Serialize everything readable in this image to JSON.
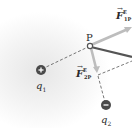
{
  "diagram": {
    "point": {
      "label": "P"
    },
    "charges": [
      {
        "id": "q1",
        "label": "q",
        "subscript": "1",
        "sign": "+",
        "color": "#4a4a4a"
      },
      {
        "id": "q2",
        "label": "q",
        "subscript": "2",
        "sign": "−",
        "color": "#4a4a4a"
      }
    ],
    "vectors": [
      {
        "id": "F1P",
        "symbol": "F",
        "arrow": "→",
        "superscript": "E",
        "subscript": "1P",
        "color": "#bdbdbd"
      },
      {
        "id": "F2P",
        "symbol": "F",
        "arrow": "→",
        "superscript": "E",
        "subscript": "2P",
        "color": "#bdbdbd"
      }
    ],
    "net_vector_color": "#555555",
    "dashed_line_color": "#555555"
  }
}
